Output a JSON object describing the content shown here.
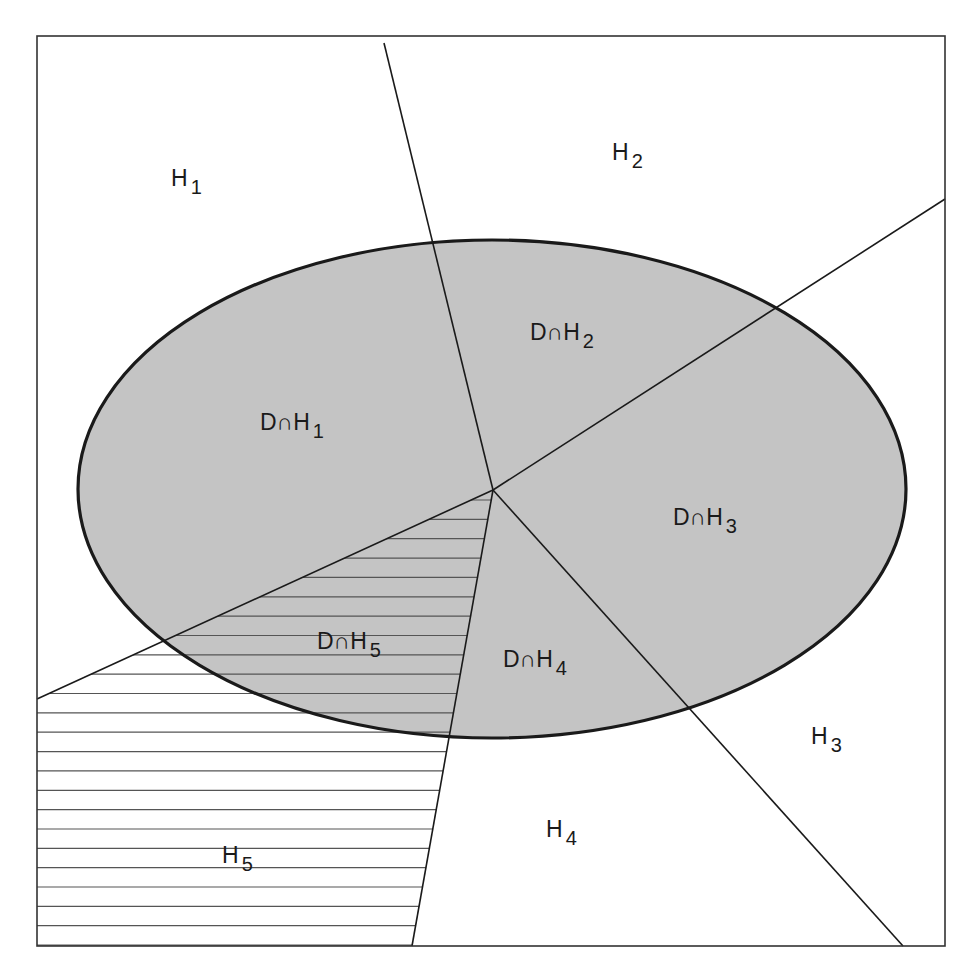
{
  "figure": {
    "frame": {
      "x1": 37,
      "y1": 36,
      "x2": 945,
      "y2": 946,
      "stroke": "#333333"
    },
    "ellipse": {
      "name": "D",
      "cx": 492,
      "cy": 489,
      "rx": 414,
      "ry": 249,
      "fill": "#c4c4c4",
      "stroke": "#1a1a1a"
    },
    "center_point": {
      "x": 493,
      "y": 490
    },
    "boundary_lines": [
      {
        "id": "H1-H2",
        "x2": 384,
        "y2": 43
      },
      {
        "id": "H2-H3",
        "x2": 945,
        "y2": 199
      },
      {
        "id": "H3-H4",
        "x2": 903,
        "y2": 946
      },
      {
        "id": "H4-H5",
        "x2": 412,
        "y2": 946
      },
      {
        "id": "H5-H1",
        "x2": 37,
        "y2": 699
      }
    ],
    "hatch": {
      "region": "H5",
      "spacing": 19.35,
      "start_y": 500,
      "color": "#555555"
    },
    "region_labels": [
      {
        "id": "H1",
        "main": "H",
        "sub": "1",
        "x": 171,
        "y": 186
      },
      {
        "id": "H2",
        "main": "H",
        "sub": "2",
        "x": 612,
        "y": 160
      },
      {
        "id": "H3",
        "main": "H",
        "sub": "3",
        "x": 811,
        "y": 744
      },
      {
        "id": "H4",
        "main": "H",
        "sub": "4",
        "x": 546,
        "y": 837
      },
      {
        "id": "H5",
        "main": "H",
        "sub": "5",
        "x": 222,
        "y": 863
      }
    ],
    "intersection_labels": [
      {
        "id": "D∩H1",
        "main": "D∩H",
        "sub": "1",
        "x": 260,
        "y": 430
      },
      {
        "id": "D∩H2",
        "main": "D∩H",
        "sub": "2",
        "x": 530,
        "y": 340
      },
      {
        "id": "D∩H3",
        "main": "D∩H",
        "sub": "3",
        "x": 673,
        "y": 525
      },
      {
        "id": "D∩H4",
        "main": "D∩H",
        "sub": "4",
        "x": 503,
        "y": 667
      },
      {
        "id": "D∩H5",
        "main": "D∩H",
        "sub": "5",
        "x": 317,
        "y": 649
      }
    ]
  }
}
